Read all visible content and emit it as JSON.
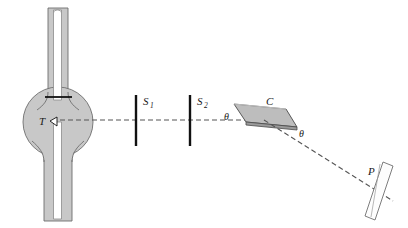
{
  "figure": {
    "background_color": "#ffffff",
    "width": 408,
    "height": 228
  },
  "colors": {
    "tube_fill": "#c8c8c8",
    "tube_stroke": "#6e6e6e",
    "bulb_fill": "#c8c8c8",
    "bulb_stroke": "#6e6e6e",
    "inner_channel_fill": "#ffffff",
    "slit_color": "#111111",
    "crystal_fill": "#bdbdbd",
    "crystal_stroke": "#555555",
    "plate_fill": "#fdfdfd",
    "plate_stroke": "#6e6e6e",
    "ray_color": "#555555",
    "label_color": "#1a1a1a",
    "electrode_color": "#111111"
  },
  "labels": {
    "target": "T",
    "slit1": "S",
    "slit1_sub": "1",
    "slit2": "S",
    "slit2_sub": "2",
    "crystal": "C",
    "theta_incident": "θ",
    "theta_reflected": "θ",
    "plate": "P"
  },
  "components": {
    "xray_tube": {
      "name": "x-ray-tube",
      "bulb_center": [
        58,
        122
      ],
      "bulb_radius": 35,
      "upper_stem": {
        "x": 48,
        "y": 8,
        "width": 20,
        "height": 100
      },
      "lower_stem": {
        "x": 44,
        "y": 140,
        "width": 28,
        "height": 80
      },
      "inner_channel_upper": {
        "x": 53,
        "y": 10,
        "width": 9,
        "height": 96
      },
      "inner_channel_lower": {
        "x": 53,
        "y": 122,
        "width": 9,
        "height": 96
      },
      "electrode_y": 97,
      "target_label_at": [
        41,
        124
      ]
    },
    "slit1": {
      "name": "slit-s1",
      "x": 136,
      "y_top": 95,
      "y_bottom": 146,
      "label_at": [
        143,
        103
      ]
    },
    "slit2": {
      "name": "slit-s2",
      "x": 190,
      "y_top": 95,
      "y_bottom": 146,
      "label_at": [
        197,
        103
      ]
    },
    "crystal": {
      "name": "crystal",
      "polygon": "234,104 286,109 297,127 246,122",
      "label_at": [
        270,
        104
      ]
    },
    "plate": {
      "name": "photographic-plate",
      "polygon": "382,163 392,167 374,219 364,215",
      "label_at": [
        371,
        172
      ]
    },
    "beam": {
      "incident_from": [
        60,
        120
      ],
      "incident_to": [
        264,
        120
      ],
      "reflected_from": [
        264,
        120
      ],
      "reflected_to": [
        392,
        200
      ],
      "dash_pattern": "5,3"
    }
  },
  "annotations": {
    "theta_incident_at": [
      226,
      118
    ],
    "theta_reflected_at": [
      301,
      134
    ]
  }
}
